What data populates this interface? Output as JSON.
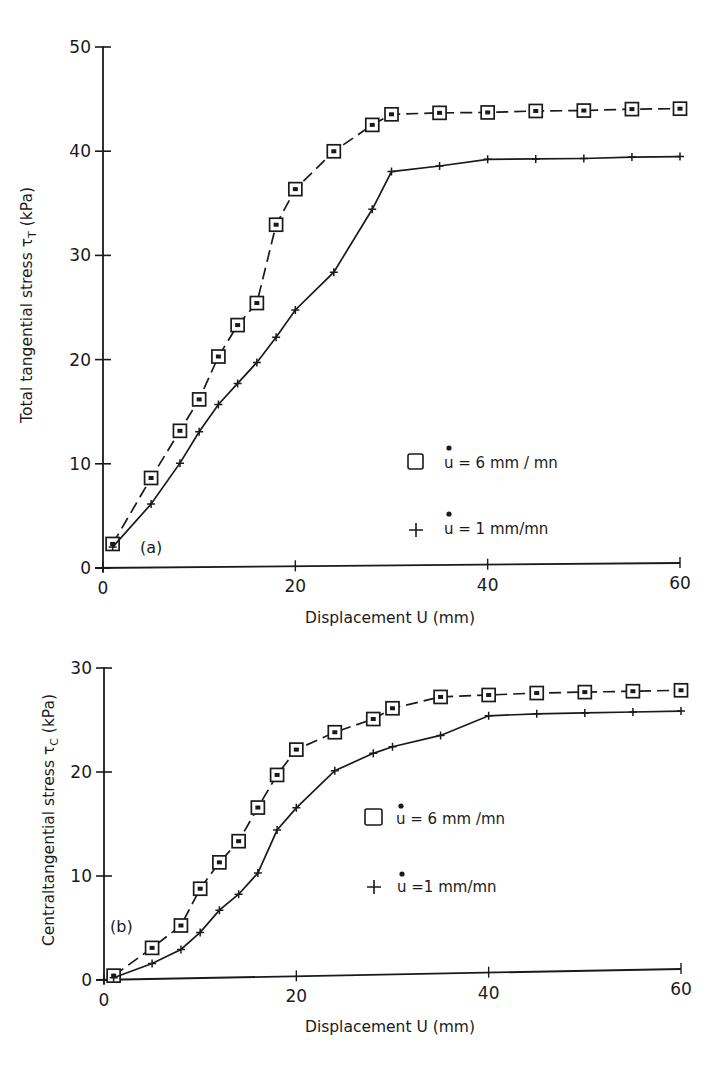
{
  "figure": {
    "ink_color": "#1a1a1a",
    "background": "#ffffff"
  },
  "chart_data": [
    {
      "type": "line",
      "panel_label": "(a)",
      "title": "",
      "xlabel": "Displacement U (mm)",
      "ylabel": "Total tangential stress τT (kPa)",
      "ylabel_main": "Total tangential stress τ",
      "ylabel_sub": "T",
      "ylabel_unit": " (kPa)",
      "xlim": [
        0,
        60
      ],
      "ylim": [
        0,
        50
      ],
      "xticks": [
        0,
        20,
        40,
        60
      ],
      "yticks": [
        0,
        10,
        20,
        30,
        40,
        50
      ],
      "grid": false,
      "legend_position": "inside-right",
      "series": [
        {
          "name": "u̇ = 6 mm/mn",
          "legend_label": "u = 6 mm / mn",
          "marker": "square",
          "line": "dashed",
          "x": [
            1,
            5,
            8,
            10,
            12,
            14,
            16,
            18,
            20,
            24,
            28,
            30,
            35,
            40,
            45,
            50,
            55,
            60
          ],
          "y": [
            2.3,
            8.6,
            13.1,
            16.1,
            20.2,
            23.2,
            25.3,
            32.8,
            36.2,
            39.8,
            42.3,
            43.3,
            43.4,
            43.4,
            43.5,
            43.5,
            43.6,
            43.6
          ]
        },
        {
          "name": "u̇ = 1 mm/mn",
          "legend_label": "u = 1 mm/mn",
          "marker": "plus",
          "line": "solid",
          "x": [
            1,
            5,
            8,
            10,
            12,
            14,
            16,
            18,
            20,
            24,
            28,
            30,
            35,
            40,
            45,
            50,
            55,
            60
          ],
          "y": [
            2.0,
            6.1,
            10.0,
            13.0,
            15.6,
            17.6,
            19.6,
            22.0,
            24.6,
            28.2,
            34.2,
            37.8,
            38.3,
            38.9,
            38.9,
            38.9,
            39.0,
            39.0
          ]
        }
      ]
    },
    {
      "type": "line",
      "panel_label": "(b)",
      "title": "",
      "xlabel": "Displacement U (mm)",
      "ylabel": "Centraltangential stress τC (kPa)",
      "ylabel_main": "Centraltangential stress τ",
      "ylabel_sub": "C",
      "ylabel_unit": " (kPa)",
      "xlim": [
        0,
        60
      ],
      "ylim": [
        0,
        30
      ],
      "xticks": [
        0,
        20,
        40,
        60
      ],
      "yticks": [
        0,
        10,
        20,
        30
      ],
      "grid": false,
      "legend_position": "inside-right",
      "series": [
        {
          "name": "u̇ = 6 mm/mn",
          "legend_label": "u = 6 mm /mn",
          "marker": "square",
          "line": "dashed",
          "x": [
            1,
            5,
            8,
            10,
            12,
            14,
            16,
            18,
            20,
            24,
            28,
            30,
            35,
            40,
            45,
            50,
            55,
            60
          ],
          "y": [
            0.4,
            3.0,
            5.1,
            8.6,
            11.1,
            13.1,
            16.3,
            19.4,
            21.8,
            23.4,
            24.6,
            25.6,
            26.6,
            26.7,
            26.8,
            26.8,
            26.8,
            26.8
          ]
        },
        {
          "name": "u̇ = 1 mm/mn",
          "legend_label": "u =1 mm/mn",
          "marker": "plus",
          "line": "solid",
          "x": [
            1,
            5,
            8,
            10,
            12,
            14,
            16,
            18,
            20,
            24,
            28,
            30,
            35,
            40,
            45,
            50,
            55,
            60
          ],
          "y": [
            0.2,
            1.5,
            2.8,
            4.4,
            6.5,
            8.0,
            10.0,
            14.1,
            16.2,
            19.7,
            21.3,
            21.9,
            22.9,
            24.7,
            24.8,
            24.8,
            24.8,
            24.8
          ]
        }
      ]
    }
  ]
}
